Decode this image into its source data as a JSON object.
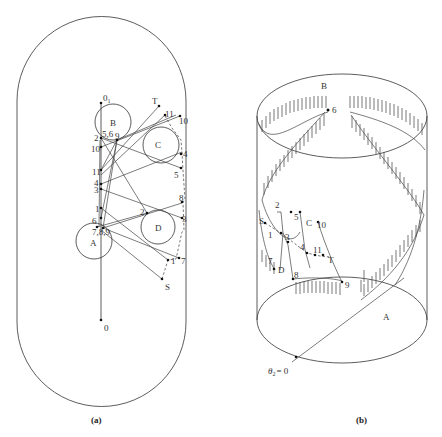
{
  "panels": {
    "a": {
      "caption": "(a)",
      "origin_labels": {
        "top": "0",
        "top_sub": "1",
        "bottom": "0"
      },
      "obstacles": [
        {
          "name": "B",
          "cx": 113,
          "cy": 122,
          "r": 18
        },
        {
          "name": "C",
          "cx": 161,
          "cy": 145,
          "r": 18
        },
        {
          "name": "A",
          "cx": 94,
          "cy": 241,
          "r": 18
        },
        {
          "name": "D",
          "cx": 158,
          "cy": 227,
          "r": 17
        }
      ],
      "endpoints": {
        "start": "S",
        "target": "T"
      },
      "left_point_labels": [
        "0₁",
        "5,6",
        "9",
        "2",
        "10",
        "11",
        "4",
        "3",
        "1",
        "6",
        "7,8,9"
      ],
      "right_point_labels": [
        "T",
        "11",
        "10",
        "4",
        "5",
        "8",
        "2",
        "3",
        "1",
        "7",
        "S"
      ]
    },
    "b": {
      "caption": "(b)",
      "cylinder_labels": {
        "top": "B",
        "bottom": "A"
      },
      "angle_label": "θ",
      "angle_sub": "2",
      "angle_value": "= 0",
      "point_labels": [
        "6",
        "S",
        "2",
        "5",
        "C",
        "1",
        "3",
        "4",
        "11",
        "T",
        "10",
        "7",
        "D",
        "8",
        "9"
      ]
    }
  }
}
